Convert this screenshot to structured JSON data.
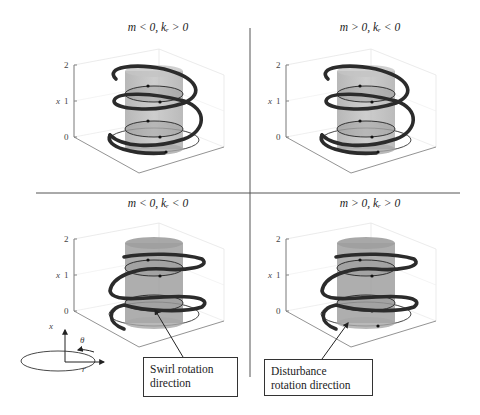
{
  "figure": {
    "panels": [
      {
        "id": "top-left",
        "title": "m < 0, kᵣ > 0",
        "m_sign": "negative",
        "kr_sign": "positive",
        "z_axis": {
          "label": "x",
          "ticks": [
            "0",
            "1",
            "2"
          ]
        }
      },
      {
        "id": "top-right",
        "title": "m > 0, kᵣ < 0",
        "m_sign": "positive",
        "kr_sign": "negative",
        "z_axis": {
          "label": "x",
          "ticks": [
            "0",
            "1",
            "2"
          ]
        }
      },
      {
        "id": "bottom-left",
        "title": "m < 0, kᵣ < 0",
        "m_sign": "negative",
        "kr_sign": "negative",
        "z_axis": {
          "label": "x",
          "ticks": [
            "0",
            "1",
            "2"
          ]
        }
      },
      {
        "id": "bottom-right",
        "title": "m > 0, kᵣ > 0",
        "m_sign": "positive",
        "kr_sign": "positive",
        "z_axis": {
          "label": "x",
          "ticks": [
            "0",
            "1",
            "2"
          ]
        }
      }
    ],
    "coordinate_legend": {
      "axial": "x",
      "azimuthal": "θ",
      "radial": "r"
    },
    "callouts": {
      "swirl": "Swirl rotation direction",
      "swirl_line1": "Swirl rotation",
      "swirl_line2": "direction",
      "disturbance_line1": "Disturbance",
      "disturbance_line2": "rotation direction"
    },
    "colors": {
      "helix": "#2b2b2b",
      "cylinder": "#a9a9a9",
      "grid": "#dddddd",
      "divider": "#555555"
    }
  }
}
